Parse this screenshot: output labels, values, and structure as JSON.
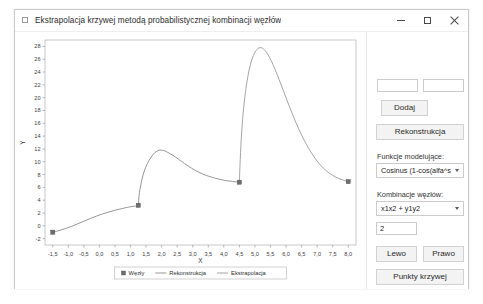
{
  "window": {
    "title": "Ekstrapolacja krzywej metodą probabilistycznej kombinacji węzłów",
    "minimize_label": "—",
    "maximize_label": "□",
    "close_label": "×"
  },
  "panel": {
    "input_x": "",
    "input_x_placeholder": "",
    "input_y": "",
    "input_y_placeholder": "",
    "add_label": "Dodaj",
    "reconstruct_label": "Rekonstrukcja",
    "model_functions_label": "Funkcje modelujące:",
    "model_functions_value": "Cosinus (1-cos(alfa^s \" ...",
    "node_combination_label": "Kombinacje węzłów:",
    "node_combination_value": "x1x2 + y1y2",
    "param_value": "2",
    "left_label": "Lewo",
    "right_label": "Prawo",
    "curve_points_label": "Punkty krzywej"
  },
  "chart_data": {
    "type": "line",
    "title": "",
    "xlabel": "X",
    "ylabel": "Y",
    "xlim": [
      -1.75,
      8.25
    ],
    "ylim": [
      -3,
      29
    ],
    "grid": false,
    "legend_position": "bottom-center",
    "xticks": [
      -1.5,
      -1.0,
      -0.5,
      0.0,
      0.5,
      1.0,
      1.5,
      2.0,
      2.5,
      3.0,
      3.5,
      4.0,
      4.5,
      5.0,
      5.5,
      6.0,
      6.5,
      7.0,
      7.5,
      8.0
    ],
    "xticklabels": [
      "-1,5",
      "-1,0",
      "-0,5",
      "0,0",
      "0,5",
      "1,0",
      "1,5",
      "2,0",
      "2,5",
      "3,0",
      "3,5",
      "4,0",
      "4,5",
      "5,0",
      "5,5",
      "6,0",
      "6,5",
      "7,0",
      "7,5",
      "8,0"
    ],
    "yticks": [
      -2,
      0,
      2,
      4,
      6,
      8,
      10,
      12,
      14,
      16,
      18,
      20,
      22,
      24,
      26,
      28
    ],
    "yticklabels": [
      "-2",
      "0",
      "2",
      "4",
      "6",
      "8",
      "10",
      "12",
      "14",
      "16",
      "18",
      "20",
      "22",
      "24",
      "26",
      "28"
    ],
    "legend": [
      {
        "label": "Węzły",
        "marker": "square",
        "color": "#6e6e6e"
      },
      {
        "label": "Rekonstrukcja",
        "marker": "line",
        "color": "#8a8a8a"
      },
      {
        "label": "Ekstrapolacja",
        "marker": "line",
        "color": "#9a9a9a"
      }
    ],
    "series": [
      {
        "name": "Węzły",
        "type": "scatter",
        "marker": "square",
        "color": "#6e6e6e",
        "points": [
          {
            "x": -1.5,
            "y": -1.0
          },
          {
            "x": 1.25,
            "y": 3.2
          },
          {
            "x": 4.5,
            "y": 6.8
          },
          {
            "x": 8.0,
            "y": 6.9
          }
        ]
      },
      {
        "name": "Rekonstrukcja",
        "type": "line",
        "color": "#8a8a8a",
        "points": [
          {
            "x": -1.5,
            "y": -1.0
          },
          {
            "x": -1.3,
            "y": -0.75
          },
          {
            "x": -1.1,
            "y": -0.45
          },
          {
            "x": -0.9,
            "y": -0.1
          },
          {
            "x": -0.7,
            "y": 0.3
          },
          {
            "x": -0.5,
            "y": 0.72
          },
          {
            "x": -0.3,
            "y": 1.12
          },
          {
            "x": -0.1,
            "y": 1.5
          },
          {
            "x": 0.1,
            "y": 1.85
          },
          {
            "x": 0.3,
            "y": 2.15
          },
          {
            "x": 0.5,
            "y": 2.42
          },
          {
            "x": 0.7,
            "y": 2.66
          },
          {
            "x": 0.9,
            "y": 2.88
          },
          {
            "x": 1.05,
            "y": 3.02
          },
          {
            "x": 1.25,
            "y": 3.2
          },
          {
            "x": 1.26,
            "y": 4.0
          },
          {
            "x": 1.3,
            "y": 5.6
          },
          {
            "x": 1.36,
            "y": 7.1
          },
          {
            "x": 1.44,
            "y": 8.5
          },
          {
            "x": 1.54,
            "y": 9.7
          },
          {
            "x": 1.66,
            "y": 10.7
          },
          {
            "x": 1.78,
            "y": 11.4
          },
          {
            "x": 1.92,
            "y": 11.8
          },
          {
            "x": 2.06,
            "y": 11.75
          },
          {
            "x": 2.2,
            "y": 11.45
          },
          {
            "x": 2.36,
            "y": 11.0
          },
          {
            "x": 2.54,
            "y": 10.4
          },
          {
            "x": 2.74,
            "y": 9.7
          },
          {
            "x": 2.96,
            "y": 9.0
          },
          {
            "x": 3.2,
            "y": 8.35
          },
          {
            "x": 3.44,
            "y": 7.85
          },
          {
            "x": 3.7,
            "y": 7.45
          },
          {
            "x": 3.96,
            "y": 7.15
          },
          {
            "x": 4.2,
            "y": 6.97
          },
          {
            "x": 4.5,
            "y": 6.8
          }
        ]
      },
      {
        "name": "Ekstrapolacja",
        "type": "line",
        "color": "#9a9a9a",
        "points": [
          {
            "x": 4.5,
            "y": 6.8
          },
          {
            "x": 4.52,
            "y": 9.5
          },
          {
            "x": 4.56,
            "y": 13.5
          },
          {
            "x": 4.62,
            "y": 17.5
          },
          {
            "x": 4.7,
            "y": 21.0
          },
          {
            "x": 4.8,
            "y": 24.0
          },
          {
            "x": 4.92,
            "y": 26.2
          },
          {
            "x": 5.06,
            "y": 27.5
          },
          {
            "x": 5.2,
            "y": 27.8
          },
          {
            "x": 5.34,
            "y": 27.3
          },
          {
            "x": 5.48,
            "y": 26.2
          },
          {
            "x": 5.64,
            "y": 24.5
          },
          {
            "x": 5.82,
            "y": 22.3
          },
          {
            "x": 6.0,
            "y": 20.0
          },
          {
            "x": 6.2,
            "y": 17.5
          },
          {
            "x": 6.4,
            "y": 15.2
          },
          {
            "x": 6.6,
            "y": 13.2
          },
          {
            "x": 6.8,
            "y": 11.5
          },
          {
            "x": 7.0,
            "y": 10.1
          },
          {
            "x": 7.2,
            "y": 9.0
          },
          {
            "x": 7.4,
            "y": 8.2
          },
          {
            "x": 7.6,
            "y": 7.6
          },
          {
            "x": 7.8,
            "y": 7.2
          },
          {
            "x": 8.0,
            "y": 6.9
          }
        ]
      }
    ]
  }
}
